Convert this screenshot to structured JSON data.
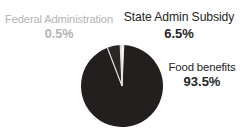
{
  "chart_data": {
    "type": "pie",
    "title": "",
    "subtitle": "",
    "xlabel": "",
    "ylabel": "",
    "legend_position": "callout-labels",
    "grid": false,
    "total_percent": 100.0,
    "categories": [
      "Food benefits",
      "State Admin Subsidy",
      "Federal Administration"
    ],
    "values": [
      93.5,
      6.5,
      0.5
    ],
    "value_labels": [
      "93.5%",
      "6.5%",
      "0.5%"
    ],
    "slices": [
      {
        "name": "Food benefits",
        "value": 93.5,
        "value_label": "93.5%",
        "color": "#231f1e",
        "label_color": "#262626",
        "start_angle_deg": 2.5,
        "end_angle_deg": 339.1
      },
      {
        "name": "State Admin Subsidy",
        "value": 6.5,
        "value_label": "6.5%",
        "color": "#2b2726",
        "label_color": "#262626",
        "start_angle_deg": 339.1,
        "end_angle_deg": 357.5
      },
      {
        "name": "Federal Administration",
        "value": 0.5,
        "value_label": "0.5%",
        "color": "#3a3534",
        "label_color": "#b4b4b4",
        "start_angle_deg": 357.5,
        "end_angle_deg": 359.3
      }
    ],
    "geometry": {
      "center_x": 122,
      "center_y": 86,
      "radius": 41,
      "separator_color": "#e8e8e6",
      "separator_width": 1.1
    },
    "background_color": "#ffffff"
  },
  "labels": {
    "federal_administration": {
      "name": "Federal Administration",
      "value": "0.5%"
    },
    "state_admin_subsidy": {
      "name": "State Admin Subsidy",
      "value": "6.5%"
    },
    "food_benefits": {
      "name": "Food benefits",
      "value": "93.5%"
    }
  }
}
